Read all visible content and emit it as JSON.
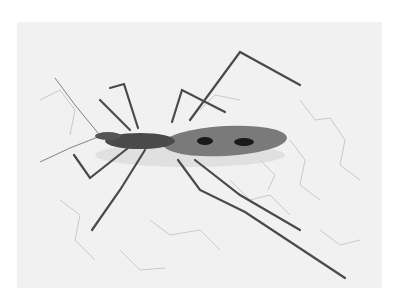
{
  "image": {
    "subject": "assassin bug on cracked white surface",
    "colors": {
      "background": "#ffffff",
      "surface": "#f1f1f1",
      "crack": "#b8b8b8",
      "body": "#6e6e6e",
      "body_dark": "#3a3a3a",
      "spot": "#1a1a1a",
      "leg": "#4a4a4a"
    }
  }
}
